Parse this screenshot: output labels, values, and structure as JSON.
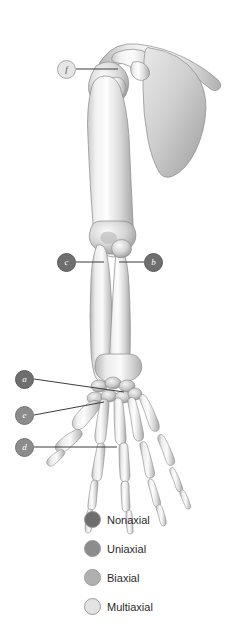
{
  "figure": {
    "background_color": "#ffffff",
    "width": 234,
    "height": 644
  },
  "markers": [
    {
      "id": "f",
      "label": "f",
      "shade": "pale",
      "x": 57,
      "y": 60,
      "joint": "glenohumeral-shoulder-joint",
      "axis_class": "Multiaxial"
    },
    {
      "id": "c",
      "label": "c",
      "shade": "dark",
      "x": 57,
      "y": 253,
      "joint": "proximal-radioulnar-joint",
      "axis_class": "Nonaxial"
    },
    {
      "id": "b",
      "label": "b",
      "shade": "dark",
      "x": 144,
      "y": 253,
      "joint": "humeroulnar-elbow-joint",
      "axis_class": "Nonaxial"
    },
    {
      "id": "a",
      "label": "a",
      "shade": "dark",
      "x": 15,
      "y": 370,
      "joint": "intercarpal-joint",
      "axis_class": "Nonaxial"
    },
    {
      "id": "e",
      "label": "e",
      "shade": "mid",
      "x": 15,
      "y": 406,
      "joint": "carpometacarpal-thumb-joint",
      "axis_class": "Uniaxial"
    },
    {
      "id": "d",
      "label": "d",
      "shade": "mid",
      "x": 15,
      "y": 438,
      "joint": "metacarpophalangeal-joint",
      "axis_class": "Biaxial"
    }
  ],
  "legend": {
    "items": [
      {
        "label": "Nonaxial",
        "color": "#6e6e6e"
      },
      {
        "label": "Uniaxial",
        "color": "#8c8c8c"
      },
      {
        "label": "Biaxial",
        "color": "#b0b0b0"
      },
      {
        "label": "Multiaxial",
        "color": "#e3e3e3"
      }
    ]
  },
  "bone_regions": [
    "clavicle",
    "scapula",
    "humerus",
    "radius",
    "ulna",
    "carpals",
    "metacarpals",
    "phalanges"
  ]
}
